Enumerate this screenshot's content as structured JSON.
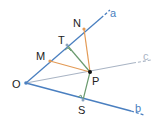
{
  "diagram": {
    "title": "",
    "colors": {
      "ray_a": "#4a7fc0",
      "ray_b": "#4a7fc0",
      "ray_c": "#a9b4c4",
      "orange": "#e39a55",
      "green": "#6a9a6e",
      "point": "#111111",
      "label": "#222222"
    },
    "points": {
      "O": {
        "label": "O",
        "x": 26,
        "y": 83
      },
      "N": {
        "label": "N",
        "x": 84,
        "y": 29
      },
      "T": {
        "label": "T",
        "x": 67,
        "y": 45
      },
      "M": {
        "label": "M",
        "x": 50,
        "y": 61
      },
      "P": {
        "label": "P",
        "x": 90,
        "y": 72
      },
      "S": {
        "label": "S",
        "x": 83,
        "y": 100
      }
    },
    "rays": {
      "a": {
        "label": "a"
      },
      "b": {
        "label": "b"
      },
      "c": {
        "label": "c"
      }
    },
    "segments": [
      {
        "from": "M",
        "to": "P",
        "color": "orange"
      },
      {
        "from": "N",
        "to": "P",
        "color": "orange"
      },
      {
        "from": "T",
        "to": "P",
        "color": "green"
      },
      {
        "from": "S",
        "to": "P",
        "color": "green"
      }
    ],
    "right_angles": [
      "T",
      "S"
    ]
  }
}
